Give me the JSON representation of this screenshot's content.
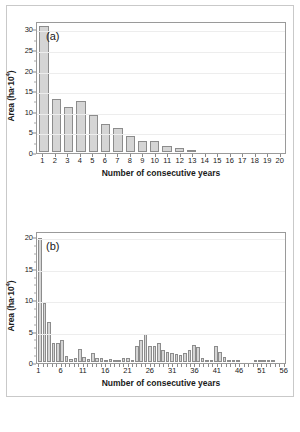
{
  "figure": {
    "background": "#ffffff",
    "bar_fill": "#d5d5d5",
    "bar_stroke": "#8c8c8c",
    "axis_color": "#9a9a9a",
    "grid_color": "#ededed"
  },
  "panels": {
    "a": {
      "tag": "(a)",
      "xlabel": "Number of consecutive years",
      "ylabel_main": "Area (ha·10",
      "ylabel_exp": "4",
      "ylabel_tail": ")"
    },
    "b": {
      "tag": "(b)",
      "xlabel": "Number of consecutive years",
      "ylabel_main": "Area (ha·10",
      "ylabel_exp": "4",
      "ylabel_tail": ")"
    }
  },
  "chart_data": [
    {
      "type": "bar",
      "title": "(a)",
      "xlabel": "Number of consecutive years",
      "ylabel": "Area (ha·10⁴)",
      "xlim": [
        0.5,
        20.5
      ],
      "ylim": [
        0,
        32
      ],
      "yticks": [
        0,
        5,
        10,
        15,
        20,
        25,
        30
      ],
      "ytick_labels": [
        "0",
        "5",
        "10",
        "15",
        "20",
        "25",
        "30"
      ],
      "yminor_step": 2.5,
      "grid": true,
      "legend": "none",
      "categories": [
        1,
        2,
        3,
        4,
        5,
        6,
        7,
        8,
        9,
        10,
        11,
        12,
        13,
        14,
        15,
        16,
        17,
        18,
        19,
        20
      ],
      "xtick_labels": [
        "1",
        "2",
        "3",
        "4",
        "5",
        "6",
        "7",
        "8",
        "9",
        "10",
        "11",
        "12",
        "13",
        "14",
        "15",
        "16",
        "17",
        "18",
        "19",
        "20"
      ],
      "values": [
        31.0,
        13.0,
        11.0,
        12.5,
        9.0,
        7.0,
        6.0,
        4.0,
        2.7,
        2.8,
        1.5,
        1.1,
        0.2,
        0.0,
        0.0,
        0.0,
        0.0,
        0.0,
        0.0,
        0.0
      ]
    },
    {
      "type": "bar",
      "title": "(b)",
      "xlabel": "Number of consecutive years",
      "ylabel": "Area (ha·10⁴)",
      "xlim": [
        0.5,
        56.5
      ],
      "ylim": [
        0,
        21
      ],
      "yticks": [
        0,
        5,
        10,
        15,
        20
      ],
      "ytick_labels": [
        "0",
        "5",
        "10",
        "15",
        "20"
      ],
      "yminor_step": 1.25,
      "grid": true,
      "legend": "none",
      "categories": [
        1,
        2,
        3,
        4,
        5,
        6,
        7,
        8,
        9,
        10,
        11,
        12,
        13,
        14,
        15,
        16,
        17,
        18,
        19,
        20,
        21,
        22,
        23,
        24,
        25,
        26,
        27,
        28,
        29,
        30,
        31,
        32,
        33,
        34,
        35,
        36,
        37,
        38,
        39,
        40,
        41,
        42,
        43,
        44,
        45,
        46,
        47,
        48,
        49,
        50,
        51,
        52,
        53,
        54,
        55,
        56
      ],
      "xtick_labels_at": [
        1,
        6,
        11,
        16,
        21,
        26,
        31,
        36,
        41,
        46,
        51,
        56
      ],
      "xtick_labels": [
        "1",
        "6",
        "11",
        "16",
        "21",
        "26",
        "31",
        "36",
        "41",
        "46",
        "51",
        "56"
      ],
      "values": [
        20.0,
        9.5,
        6.5,
        3.0,
        3.0,
        3.5,
        0.9,
        0.5,
        0.7,
        2.1,
        0.8,
        0.5,
        1.4,
        0.7,
        0.6,
        0.3,
        0.5,
        0.3,
        0.3,
        0.6,
        0.6,
        0.3,
        2.6,
        3.5,
        4.6,
        2.6,
        2.6,
        3.0,
        2.0,
        1.6,
        1.4,
        1.3,
        1.2,
        1.4,
        1.9,
        2.8,
        2.5,
        0.6,
        0.3,
        0.3,
        2.6,
        1.6,
        0.8,
        0.2,
        0.1,
        0.05,
        0.0,
        0.0,
        0.0,
        0.1,
        0.2,
        0.15,
        0.1,
        0.05,
        0.0,
        0.0
      ]
    }
  ]
}
